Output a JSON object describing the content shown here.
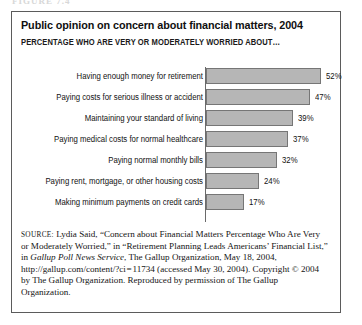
{
  "artifact": {
    "top_cut_text": "FIGURE 7.4"
  },
  "figure": {
    "title": "Public opinion on concern about financial matters, 2004",
    "subtitle": "PERCENTAGE WHO ARE VERY OR MODERATELY WORRIED ABOUT…"
  },
  "source": {
    "label": "SOURCE:",
    "part1": " Lydia Said, “Concern about Financial Matters Percentage Who Are Very or Moderately Worried,” in “Retirement Planning Leads Americans’ Financial List,” in ",
    "italic_title": "Gallup Poll News Service",
    "part2": ", The Gallup Organization, May 18, 2004, http://gallup.com/content/?ci = 11734 (accessed May 30, 2004). Copyright © 2004 by The Gallup Organization. Reproduced by permission of The Gallup Organization."
  },
  "colors": {
    "bar_fill": "#b6b6b6",
    "bar_border": "#767676",
    "frame": "#5b5b5b",
    "text": "#111111"
  },
  "chart_data": {
    "type": "bar",
    "orientation": "horizontal",
    "title": "Public opinion on concern about financial matters, 2004",
    "subtitle": "PERCENTAGE WHO ARE VERY OR MODERATELY WORRIED ABOUT…",
    "xlabel": "",
    "ylabel": "",
    "xlim": [
      0,
      55
    ],
    "grid": false,
    "legend": false,
    "value_suffix": "%",
    "categories": [
      "Having enough money for retirement",
      "Paying costs for serious illness or accident",
      "Maintaining your standard of living",
      "Paying medical costs for normal healthcare",
      "Paying normal monthly bills",
      "Paying rent, mortgage, or other housing costs",
      "Making minimum payments on credit cards"
    ],
    "values": [
      52,
      47,
      39,
      37,
      32,
      24,
      17
    ],
    "value_labels": [
      "52%",
      "47%",
      "39%",
      "37%",
      "32%",
      "24%",
      "17%"
    ]
  }
}
